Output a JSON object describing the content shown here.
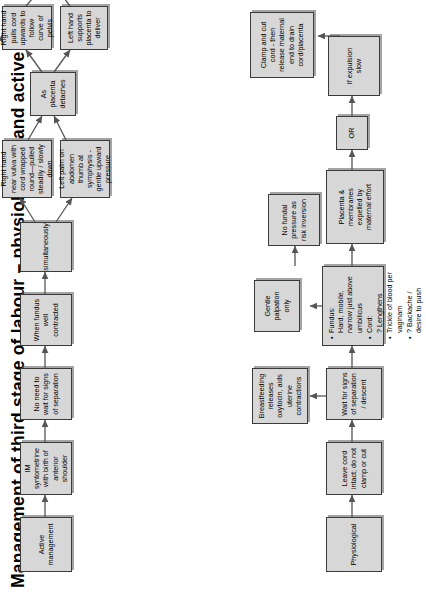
{
  "title": "Management of third stage of labour – physiological and active",
  "colors": {
    "box_fill": "#d7d7d7",
    "box_border": "#3b3b3b",
    "arrow": "#555555",
    "text": "#000000",
    "background": "#ffffff"
  },
  "active_branch": {
    "start": "Active management",
    "nodes": {
      "syntometrine": "IM syntometrine with birth of anterior shoulder",
      "no_wait": "No need to wait for signs of separation",
      "fundus_contracted": "When fundus well contracted",
      "simultaneously": "simultaneously",
      "right_hand_vulva": "Right hand near vulva with cord wrapped round—pulled steadily / slowly down",
      "left_palm_abdomen": "Left palm on abdomen thumb at symphysis - gentle upward pressure",
      "placenta_detaches": "As placenta detaches",
      "right_hand_pulls": "Right hand pulls cord upwards to follow curve of pelvis",
      "left_hand_supports": "Left hand supports placenta to deliver",
      "membranes_fail": "If membranes fail to separate",
      "rope_membranes": "Using both hands - turn placenta to ‘rope’ membranes - gentle upward & downward motion to encourage separation / delivery"
    }
  },
  "physiological_branch": {
    "start": "Physiological",
    "nodes": {
      "leave_cord": "Leave cord intact; do not clamp or cut",
      "wait_signs": "Wait for signs of separation / descent",
      "breastfeeding": "Breastfeeding releases oxytocin, aids uterine contractions",
      "gentle_palpation": "Gentle palpation only",
      "no_fundal_pressure": "No fundal pressure as risk inversion",
      "expelled": "Placenta & membranes expelled by maternal effort",
      "or": "OR",
      "expulsion_slow": "If expulsion slow",
      "clamp_cut": "Clamp and cut cord - then release maternal end to drain cord/placenta"
    },
    "signs_list": {
      "items": [
        "Fundus:\nHard, mobile, narrow just above umbilicus",
        "Cord:\n? Lengthens",
        "Trickle of blood per vaginam",
        "? Backache / desire to push"
      ]
    }
  }
}
